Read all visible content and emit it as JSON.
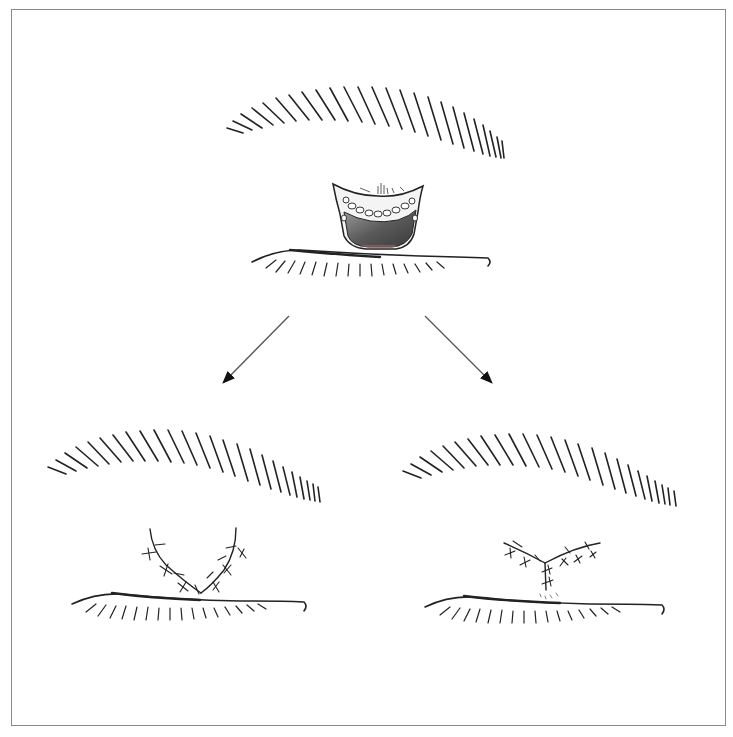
{
  "figure": {
    "title": "",
    "colors": {
      "ink": "#1a1a1a",
      "frame": "#8a8a8a",
      "defect_fill": "#6e6e6e",
      "defect_edge": "#c46a6a"
    },
    "panels": [
      {
        "id": "top",
        "label": "",
        "content": "Eye with excised upper-lid skin defect"
      },
      {
        "id": "bottom-left",
        "label": "",
        "content": "V-shaped sutured closure"
      },
      {
        "id": "bottom-right",
        "label": "",
        "content": "Y-shaped sutured closure"
      }
    ],
    "arrows": [
      {
        "from": [
          289,
          316
        ],
        "to": [
          222,
          384
        ]
      },
      {
        "from": [
          425,
          316
        ],
        "to": [
          493,
          384
        ]
      }
    ]
  }
}
